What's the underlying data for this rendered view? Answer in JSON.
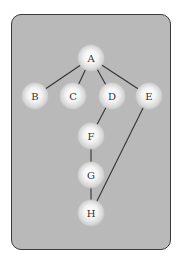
{
  "diagram": {
    "type": "tree-graph",
    "colors": {
      "background": "#b9b9b9",
      "border": "#3a3a3a",
      "edge": "#333333",
      "node_highlight": "#ffffff",
      "node_shadow": "#9a9a9a",
      "label": "#333333"
    },
    "nodes": [
      {
        "id": "A",
        "label": "A",
        "x": 91,
        "y": 58
      },
      {
        "id": "B",
        "label": "B",
        "x": 35,
        "y": 96
      },
      {
        "id": "C",
        "label": "C",
        "x": 73,
        "y": 96
      },
      {
        "id": "D",
        "label": "D",
        "x": 112,
        "y": 96
      },
      {
        "id": "E",
        "label": "E",
        "x": 149,
        "y": 96
      },
      {
        "id": "F",
        "label": "F",
        "x": 91,
        "y": 136
      },
      {
        "id": "G",
        "label": "G",
        "x": 91,
        "y": 175
      },
      {
        "id": "H",
        "label": "H",
        "x": 91,
        "y": 213
      }
    ],
    "edges": [
      {
        "from": "A",
        "to": "B"
      },
      {
        "from": "A",
        "to": "C"
      },
      {
        "from": "A",
        "to": "D"
      },
      {
        "from": "A",
        "to": "E"
      },
      {
        "from": "D",
        "to": "F"
      },
      {
        "from": "F",
        "to": "G"
      },
      {
        "from": "G",
        "to": "H"
      },
      {
        "from": "E",
        "to": "H"
      }
    ]
  }
}
